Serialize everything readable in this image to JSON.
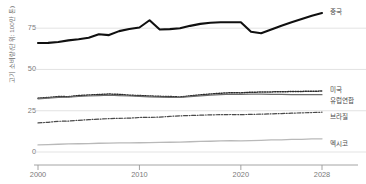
{
  "chart_data": {
    "type": "line",
    "title": "",
    "xlabel": "",
    "ylabel": "고기 소비량(단위: 100만 톤)",
    "x": [
      2000,
      2001,
      2002,
      2003,
      2004,
      2005,
      2006,
      2007,
      2008,
      2009,
      2010,
      2011,
      2012,
      2013,
      2014,
      2015,
      2016,
      2017,
      2018,
      2019,
      2020,
      2021,
      2022,
      2023,
      2024,
      2025,
      2026,
      2027,
      2028
    ],
    "xlim": [
      2000,
      2028
    ],
    "ylim": [
      0,
      86
    ],
    "xticks": [
      2000,
      2010,
      2020,
      2028
    ],
    "yticks": [
      0,
      25,
      50,
      75
    ],
    "grid": true,
    "legend_position": "right",
    "series": [
      {
        "name": "중국",
        "style": "solid",
        "color": "#101010",
        "width": 2.1,
        "values": [
          66.0,
          66.1,
          66.6,
          67.6,
          68.3,
          69.2,
          71.3,
          70.8,
          73.2,
          74.5,
          75.4,
          79.8,
          74.2,
          74.4,
          74.9,
          76.4,
          77.6,
          78.3,
          78.6,
          78.6,
          78.6,
          72.8,
          71.9,
          74.2,
          76.5,
          78.6,
          80.6,
          82.5,
          84.2
        ]
      },
      {
        "name": "미국",
        "style": "dotted",
        "color": "#2b2b2b",
        "width": 1.5,
        "values": [
          32.6,
          33.0,
          33.6,
          33.5,
          34.2,
          34.5,
          34.8,
          35.1,
          34.9,
          34.4,
          34.2,
          33.9,
          33.7,
          33.6,
          33.3,
          34.0,
          34.6,
          35.1,
          35.6,
          35.9,
          35.8,
          36.2,
          36.3,
          36.4,
          36.5,
          36.6,
          36.7,
          36.8,
          36.9
        ]
      },
      {
        "name": "유럽연합",
        "style": "solid-thin",
        "color": "#6d6d6d",
        "width": 1.2,
        "values": [
          32.2,
          32.6,
          33.1,
          33.2,
          33.6,
          33.9,
          34.2,
          34.5,
          34.2,
          33.9,
          33.7,
          33.4,
          33.2,
          33.1,
          33.0,
          33.5,
          34.0,
          34.4,
          34.8,
          35.0,
          34.9,
          35.0,
          35.0,
          34.9,
          34.9,
          34.8,
          34.8,
          34.7,
          34.7
        ]
      },
      {
        "name": "브라질",
        "style": "dashdot",
        "color": "#4a4a4a",
        "width": 1.2,
        "values": [
          17.6,
          18.0,
          18.6,
          18.7,
          19.2,
          19.6,
          19.9,
          20.2,
          20.4,
          20.5,
          20.9,
          21.0,
          21.1,
          21.6,
          21.9,
          22.1,
          22.3,
          22.5,
          22.6,
          22.7,
          22.6,
          22.8,
          22.9,
          23.1,
          23.3,
          23.5,
          23.7,
          23.9,
          24.1
        ]
      },
      {
        "name": "멕시코",
        "style": "solid-light",
        "color": "#b9b9b9",
        "width": 1.3,
        "values": [
          4.3,
          4.5,
          4.7,
          4.9,
          5.0,
          5.1,
          5.3,
          5.4,
          5.5,
          5.5,
          5.6,
          5.7,
          5.8,
          5.9,
          6.0,
          6.2,
          6.4,
          6.5,
          6.7,
          6.8,
          6.7,
          6.9,
          7.1,
          7.3,
          7.4,
          7.6,
          7.7,
          7.9,
          8.0
        ]
      }
    ]
  },
  "axes": {
    "y_title": "고기 소비량(단위: 100만 톤)",
    "y_tick_labels": [
      "75",
      "50",
      "25",
      "0"
    ],
    "x_tick_labels": [
      "2000",
      "2010",
      "2020",
      "2028"
    ]
  },
  "legend": {
    "items": [
      {
        "label": "중국"
      },
      {
        "label": "미국"
      },
      {
        "label": "유럽연합"
      },
      {
        "label": "브라질"
      },
      {
        "label": "멕시코"
      }
    ]
  }
}
